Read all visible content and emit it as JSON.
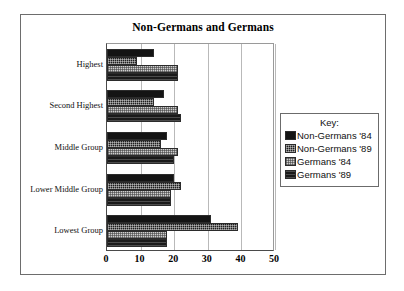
{
  "chart_data": {
    "type": "bar",
    "orientation": "horizontal",
    "title": "Non-Germans and Germans",
    "xlabel": "",
    "ylabel": "",
    "xlim": [
      0,
      50
    ],
    "xticks": [
      0,
      10,
      20,
      30,
      40,
      50
    ],
    "grid": true,
    "legend_position": "right-outside",
    "categories": [
      "Highest",
      "Second Highest",
      "Middle Group",
      "Lower Middle Group",
      "Lowest Group"
    ],
    "series": [
      {
        "name": "Non-Germans '84",
        "values": [
          14,
          17,
          18,
          20,
          31
        ],
        "fill": "solid-black",
        "color": "#141414"
      },
      {
        "name": "Non-Germans '89",
        "values": [
          9,
          14,
          16,
          22,
          39
        ],
        "fill": "dark-checker",
        "color": "#1e1e1e"
      },
      {
        "name": "Germans '84",
        "values": [
          21,
          21,
          21,
          19,
          18
        ],
        "fill": "light-checker",
        "color": "#cfcfcf"
      },
      {
        "name": "Germans '89",
        "values": [
          21,
          22,
          20,
          19,
          18
        ],
        "fill": "dark-hatch",
        "color": "#1a1a1a"
      }
    ]
  },
  "legend": {
    "title": "Key:",
    "entries": [
      "Non-Germans '84",
      "Non-Germans '89",
      "Germans '84",
      "Germans '89"
    ]
  },
  "colors": {
    "frame": "#6d6d6d",
    "axis": "#4a4a4a",
    "gridline": "#b9b9b9",
    "background": "#ffffff",
    "text": "#111111"
  }
}
